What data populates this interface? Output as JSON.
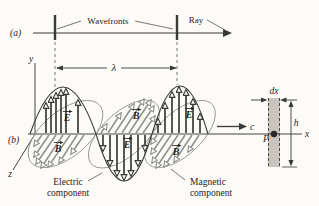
{
  "figure": {
    "colors": {
      "ink": "#3a3a3a",
      "field_gray": "#8f8f8f",
      "slice_fill": "#c9c5bd",
      "background": "#fcfbf8"
    },
    "panel_a": {
      "label": "(a)",
      "wavefronts_label": "Wavefronts",
      "ray_label": "Ray"
    },
    "panel_b": {
      "label": "(b)",
      "axis_x": "x",
      "axis_y": "y",
      "axis_z": "z",
      "wavelength": "λ",
      "speed": "c",
      "electric_symbol": "E",
      "magnetic_symbol": "B",
      "dx_label": "dx",
      "height_label": "h",
      "point_label": "P",
      "electric_caption_line1": "Electric",
      "electric_caption_line2": "component",
      "magnetic_caption_line1": "Magnetic",
      "magnetic_caption_line2": "component"
    }
  }
}
